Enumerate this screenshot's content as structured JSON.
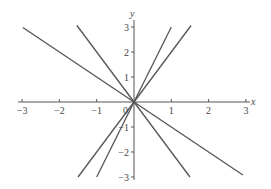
{
  "chart_data": {
    "type": "line",
    "title": "",
    "xlabel": "x",
    "ylabel": "y",
    "xlim": [
      -3,
      3
    ],
    "ylim": [
      -3,
      3
    ],
    "grid": false,
    "legend": null,
    "x_ticks": [
      -3,
      -2,
      -1,
      1,
      2,
      3
    ],
    "y_ticks": [
      -3,
      -2,
      -1,
      1,
      2,
      3
    ],
    "origin_label": "0",
    "series": [
      {
        "name": "y = -x",
        "slope": -1,
        "x": [
          -2.98,
          2.92
        ],
        "values": [
          2.98,
          -2.92
        ]
      },
      {
        "name": "y = -2x",
        "slope": -2,
        "x": [
          -1.53,
          1.5
        ],
        "values": [
          3.06,
          -3.0
        ]
      },
      {
        "name": "y = 3x",
        "slope": 3,
        "x": [
          -1.0,
          1.0
        ],
        "values": [
          -3.0,
          3.0
        ]
      },
      {
        "name": "y = 2x",
        "slope": 2,
        "x": [
          -1.5,
          1.53
        ],
        "values": [
          -3.0,
          3.06
        ]
      }
    ],
    "line_color": "#555555",
    "axis_color": "#555555"
  }
}
